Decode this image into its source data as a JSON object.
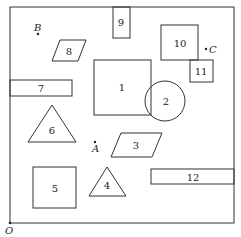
{
  "frame": {
    "x": 10,
    "y": 7,
    "width": 224,
    "height": 216,
    "origin_label": "O"
  },
  "shapes": {
    "s1": {
      "label": "1",
      "type": "square"
    },
    "s2": {
      "label": "2",
      "type": "circle"
    },
    "s3": {
      "label": "3",
      "type": "parallelogram"
    },
    "s4": {
      "label": "4",
      "type": "triangle"
    },
    "s5": {
      "label": "5",
      "type": "square"
    },
    "s6": {
      "label": "6",
      "type": "triangle"
    },
    "s7": {
      "label": "7",
      "type": "rectangle"
    },
    "s8": {
      "label": "8",
      "type": "parallelogram"
    },
    "s9": {
      "label": "9",
      "type": "rectangle"
    },
    "s10": {
      "label": "10",
      "type": "square"
    },
    "s11": {
      "label": "11",
      "type": "square"
    },
    "s12": {
      "label": "12",
      "type": "rectangle"
    }
  },
  "points": {
    "A": {
      "label": "A"
    },
    "B": {
      "label": "B"
    },
    "C": {
      "label": "C"
    }
  }
}
